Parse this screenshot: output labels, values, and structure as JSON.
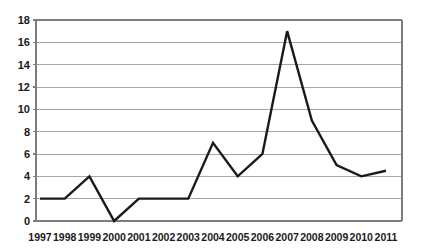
{
  "chart_data": {
    "type": "line",
    "title": "",
    "subtitle": "",
    "xlabel": "",
    "ylabel": "",
    "categories": [
      "1997",
      "1998",
      "1999",
      "2000",
      "2001",
      "2002",
      "2003",
      "2004",
      "2005",
      "2006",
      "2007",
      "2008",
      "2009",
      "2010",
      "2011"
    ],
    "values": [
      2,
      2,
      4,
      0,
      2,
      2,
      2,
      7,
      4,
      6,
      17,
      9,
      5,
      4,
      4.5
    ],
    "series": [
      {
        "name": "series-1",
        "values": [
          2,
          2,
          4,
          0,
          2,
          2,
          2,
          7,
          4,
          6,
          17,
          9,
          5,
          4,
          4.5
        ]
      }
    ],
    "ylim": [
      0,
      18
    ],
    "y_ticks": [
      0,
      2,
      4,
      6,
      8,
      10,
      12,
      14,
      16,
      18
    ],
    "y_tick_labels": [
      "0",
      "2",
      "4",
      "6",
      "8",
      "10",
      "12",
      "14",
      "16",
      "18"
    ],
    "x_tick_labels": [
      "1997",
      "1998",
      "1999",
      "2000",
      "2001",
      "2002",
      "2003",
      "2004",
      "2005",
      "2006",
      "2007",
      "2008",
      "2009",
      "2010",
      "2011"
    ],
    "grid": true,
    "grid_axis": "y",
    "legend": false,
    "legend_position": "none",
    "annotations": [],
    "line_color": "#1a1a1a",
    "grid_color": "#9b9b9b",
    "axis_color": "#7d7d7d",
    "background_color": "#ffffff",
    "line_width": 2.4
  },
  "geometry": {
    "plot_left": 36,
    "plot_right": 402,
    "plot_top": 20,
    "plot_bottom": 221,
    "first_point_x": 40,
    "last_point_x": 386
  }
}
